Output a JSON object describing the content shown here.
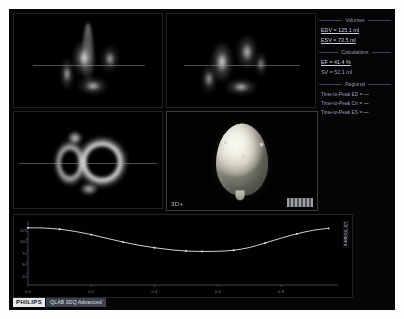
{
  "app": {
    "vendor": "PHILIPS",
    "product": "QLAB 3DQ Advanced"
  },
  "views": {
    "apical_4ch": {
      "label": "A4C"
    },
    "apical_2ch": {
      "label": "A2C"
    },
    "short_axis": {
      "label": "SAX"
    },
    "volume_3d": {
      "label": "3D+"
    }
  },
  "results": {
    "volumes": {
      "heading": "Volumes",
      "edv": "EDV = 125.1 ml",
      "esv": "ESV = 73.5 ml"
    },
    "calculations": {
      "heading": "Calculations",
      "ef": "EF = 41.4 %",
      "sv": "SV = 52.1 ml"
    },
    "regional": {
      "heading": "Regional",
      "rows": [
        {
          "label": "Time-to-Peak ED =",
          "value": "---"
        },
        {
          "label": "Time-to-Peak Ctr =",
          "value": "---"
        },
        {
          "label": "Time-to-Peak ES =",
          "value": "---"
        }
      ]
    }
  },
  "chart_data": {
    "type": "line",
    "xlabel": "Time (s)",
    "ylabel": "Volume (ml)",
    "curve_label": "LV Volume",
    "xlim": [
      0,
      0.98
    ],
    "ylim": [
      0,
      140
    ],
    "grid": false,
    "legend_position": "right",
    "x_ticks": [
      "0.0",
      "0.2",
      "0.4",
      "0.6",
      "0.8"
    ],
    "y_ticks": [
      "125",
      "100",
      "75",
      "50",
      "25"
    ],
    "series": [
      {
        "name": "LV Volume",
        "x": [
          0.0,
          0.05,
          0.1,
          0.15,
          0.2,
          0.25,
          0.3,
          0.35,
          0.4,
          0.45,
          0.5,
          0.55,
          0.6,
          0.65,
          0.7,
          0.75,
          0.8,
          0.85,
          0.9,
          0.95
        ],
        "values": [
          125.1,
          124.6,
          122.0,
          117.0,
          110.2,
          102.0,
          94.0,
          87.0,
          81.5,
          77.2,
          74.4,
          73.5,
          73.8,
          76.0,
          82.0,
          92.0,
          102.5,
          112.0,
          119.5,
          124.0
        ]
      }
    ],
    "markers_x": [
      0.0,
      0.1,
      0.2,
      0.3,
      0.4,
      0.5,
      0.55,
      0.65,
      0.75,
      0.85,
      0.95
    ]
  }
}
